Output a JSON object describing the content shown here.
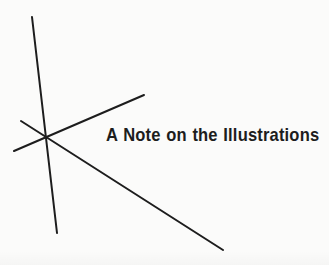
{
  "page": {
    "background_color": "#fbfbfa",
    "ink_color": "#1d1d1d",
    "title": "A Note on the Illustrations"
  },
  "illustration": {
    "name": "crossed-lines",
    "stroke_color": "#1d1d1d",
    "stroke_width": 2,
    "lines": [
      {
        "x1": 32,
        "y1": 17,
        "x2": 57,
        "y2": 233
      },
      {
        "x1": 14,
        "y1": 151,
        "x2": 144,
        "y2": 95
      },
      {
        "x1": 21,
        "y1": 121,
        "x2": 223,
        "y2": 250
      }
    ]
  }
}
